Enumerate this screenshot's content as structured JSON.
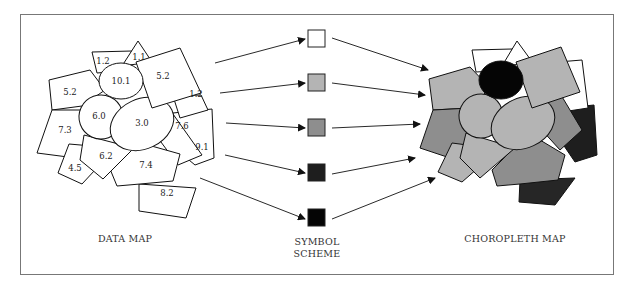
{
  "captions": {
    "data_map": "DATA MAP",
    "symbol_scheme_line1": "SYMBOL",
    "symbol_scheme_line2": "SCHEME",
    "choropleth_map": "CHOROPLETH MAP"
  },
  "data_map": {
    "regions": [
      {
        "id": "r-top-left-small",
        "value": "1.2"
      },
      {
        "id": "r-top-triangle",
        "value": "1.1"
      },
      {
        "id": "r-top-ellipse",
        "value": "10.1"
      },
      {
        "id": "r-top-right-rect",
        "value": "5.2"
      },
      {
        "id": "r-left-upper",
        "value": "5.2"
      },
      {
        "id": "r-right-upper",
        "value": "1.2"
      },
      {
        "id": "r-left-ellipse",
        "value": "6.0"
      },
      {
        "id": "r-center-ellipse",
        "value": "3.0"
      },
      {
        "id": "r-right-mid",
        "value": "7.6"
      },
      {
        "id": "r-left-lower",
        "value": "7.3"
      },
      {
        "id": "r-right-lower",
        "value": "9.1"
      },
      {
        "id": "r-bottom-left-diamond",
        "value": "6.2"
      },
      {
        "id": "r-bottom-left-small",
        "value": "4.5"
      },
      {
        "id": "r-bottom-center",
        "value": "7.4"
      },
      {
        "id": "r-bottom",
        "value": "8.2"
      }
    ]
  },
  "symbol_scheme": {
    "classes": [
      {
        "label": "class-1",
        "color": "#ffffff"
      },
      {
        "label": "class-2",
        "color": "#b4b4b4"
      },
      {
        "label": "class-3",
        "color": "#8e8e8e"
      },
      {
        "label": "class-4",
        "color": "#1e1e1e"
      },
      {
        "label": "class-5",
        "color": "#050505"
      }
    ]
  },
  "colors": {
    "stroke": "#111111",
    "frame": "#777777",
    "white": "#ffffff",
    "light": "#b4b4b4",
    "mid": "#8e8e8e",
    "dark": "#262626",
    "black": "#050505"
  }
}
